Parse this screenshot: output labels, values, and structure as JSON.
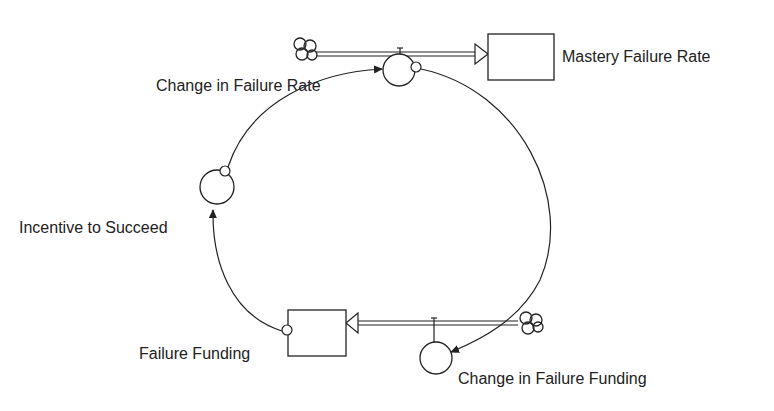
{
  "diagram": {
    "type": "stock-and-flow",
    "stocks": [
      {
        "id": "mastery_failure_rate",
        "label": "Mastery Failure Rate"
      },
      {
        "id": "failure_funding",
        "label": "Failure Funding"
      }
    ],
    "flows": [
      {
        "id": "change_in_failure_rate",
        "label": "Change in Failure Rate",
        "from": "cloud",
        "to": "mastery_failure_rate"
      },
      {
        "id": "change_in_failure_funding",
        "label": "Change in Failure Funding",
        "from": "cloud",
        "to": "failure_funding"
      }
    ],
    "auxiliaries": [
      {
        "id": "incentive_to_succeed",
        "label": "Incentive to Succeed"
      }
    ],
    "links": [
      {
        "from": "mastery_failure_rate",
        "to": "change_in_failure_funding"
      },
      {
        "from": "failure_funding",
        "to": "incentive_to_succeed"
      },
      {
        "from": "incentive_to_succeed",
        "to": "change_in_failure_rate"
      }
    ],
    "colors": {
      "stroke": "#222222",
      "background": "#ffffff"
    }
  }
}
